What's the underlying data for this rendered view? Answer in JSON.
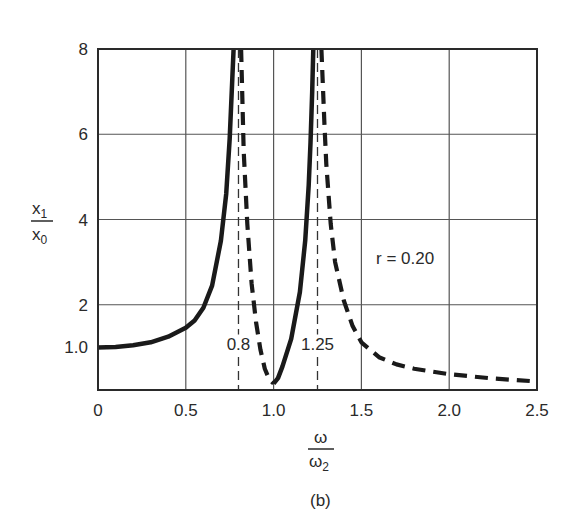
{
  "chart_data": {
    "type": "line",
    "title": "",
    "caption": "(b)",
    "xlabel": {
      "numerator": "ω",
      "denominator": "ω",
      "denominator_sub": "2"
    },
    "ylabel": {
      "numerator": "x",
      "numerator_sub": "1",
      "denominator": "x",
      "denominator_sub": "0"
    },
    "xlim": [
      0,
      2.5
    ],
    "ylim": [
      0,
      8
    ],
    "grid": true,
    "x_ticks": [
      {
        "value": 0,
        "label": "0"
      },
      {
        "value": 0.5,
        "label": "0.5"
      },
      {
        "value": 1.0,
        "label": "1.0"
      },
      {
        "value": 1.5,
        "label": "1.5"
      },
      {
        "value": 2.0,
        "label": "2.0"
      },
      {
        "value": 2.5,
        "label": "2.5"
      }
    ],
    "y_ticks": [
      {
        "value": 1.0,
        "label": "1.0"
      },
      {
        "value": 2,
        "label": "2"
      },
      {
        "value": 4,
        "label": "4"
      },
      {
        "value": 6,
        "label": "6"
      },
      {
        "value": 8,
        "label": "8"
      }
    ],
    "vertical_markers": [
      {
        "value": 0.8,
        "label": "0.8",
        "style": "dashed"
      },
      {
        "value": 1.25,
        "label": "1.25",
        "style": "dashed"
      }
    ],
    "annotation": "r = 0.20",
    "series": [
      {
        "name": "segment-1",
        "style": "solid",
        "x": [
          0,
          0.1,
          0.2,
          0.3,
          0.4,
          0.5,
          0.55,
          0.6,
          0.65,
          0.7,
          0.73,
          0.75,
          0.765,
          0.772
        ],
        "y": [
          1.0,
          1.01,
          1.05,
          1.12,
          1.25,
          1.46,
          1.63,
          1.93,
          2.45,
          3.5,
          4.6,
          5.9,
          7.3,
          8.0
        ]
      },
      {
        "name": "segment-2",
        "style": "dashed",
        "x": [
          0.815,
          0.83,
          0.85,
          0.875,
          0.9,
          0.925,
          0.95,
          0.975,
          1.0
        ],
        "y": [
          8.0,
          5.6,
          3.9,
          2.5,
          1.6,
          0.95,
          0.5,
          0.25,
          0.15
        ]
      },
      {
        "name": "segment-3",
        "style": "solid",
        "x": [
          1.0,
          1.025,
          1.05,
          1.1,
          1.15,
          1.18,
          1.2,
          1.21,
          1.22,
          1.226
        ],
        "y": [
          0.15,
          0.28,
          0.55,
          1.2,
          2.3,
          3.5,
          4.8,
          5.8,
          7.0,
          8.0
        ]
      },
      {
        "name": "segment-4",
        "style": "dashed",
        "x": [
          1.272,
          1.29,
          1.3,
          1.325,
          1.35,
          1.4,
          1.45,
          1.5,
          1.6,
          1.7,
          1.8,
          2.0,
          2.25,
          2.5
        ],
        "y": [
          8.0,
          6.2,
          5.3,
          3.9,
          3.0,
          2.1,
          1.5,
          1.12,
          0.77,
          0.6,
          0.5,
          0.37,
          0.27,
          0.2
        ]
      }
    ]
  },
  "layout": {
    "plot_left": 98,
    "plot_right": 537,
    "plot_top": 49,
    "plot_bottom": 390,
    "line_color": "#1a1a1a",
    "grid_color": "#555555"
  }
}
